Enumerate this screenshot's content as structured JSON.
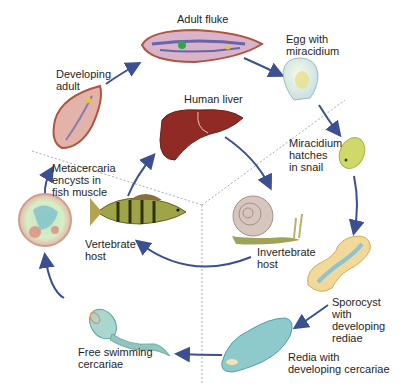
{
  "diagram": {
    "title": "",
    "arrow_color": "#3b4f91",
    "divider_color": "#8a94a8",
    "stages": [
      {
        "id": "adult-fluke",
        "label": "Adult fluke"
      },
      {
        "id": "egg",
        "label": "Egg with\nmiracidium"
      },
      {
        "id": "miracidium",
        "label": "Miracidium\nhatches\nin snail"
      },
      {
        "id": "sporocyst",
        "label": "Sporocyst\nwith\ndeveloping\nrediae"
      },
      {
        "id": "redia",
        "label": "Redia with\ndeveloping cercariae"
      },
      {
        "id": "cercariae",
        "label": "Free swimming\ncercariae"
      },
      {
        "id": "metacercaria",
        "label": "Metacercaria\nencysts in\nfish muscle"
      },
      {
        "id": "developing-adult",
        "label": "Developing\nadult"
      }
    ],
    "hosts": [
      {
        "id": "human-liver",
        "label": "Human liver"
      },
      {
        "id": "vertebrate-host",
        "label": "Vertebrate\nhost"
      },
      {
        "id": "invertebrate-host",
        "label": "Invertebrate\nhost"
      }
    ]
  }
}
